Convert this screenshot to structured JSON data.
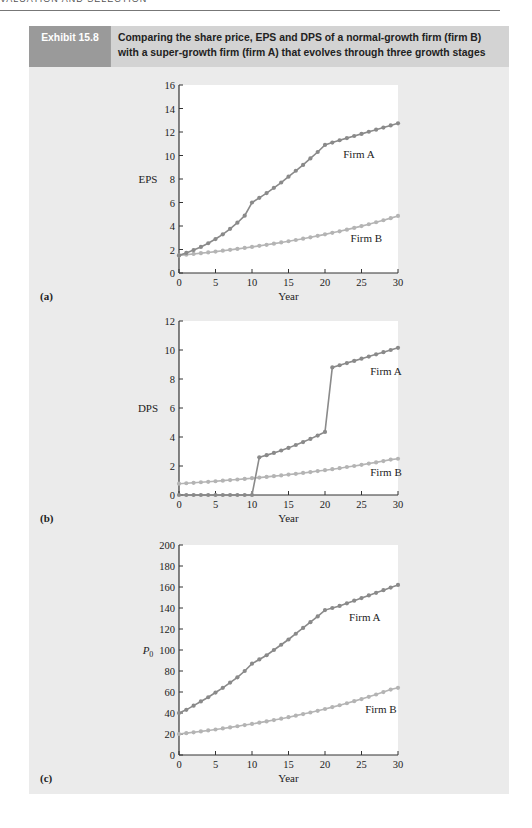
{
  "running_head": "VALUATION AND SELECTION",
  "exhibit": {
    "label": "Exhibit 15.8",
    "title_line1": "Comparing the share price, EPS and DPS of a normal-growth firm (firm B)",
    "title_line2": "with a super-growth firm (firm A) that evolves through three growth stages"
  },
  "colors": {
    "panel_bg": "#ebebeb",
    "header_bg": "#d3d3d3",
    "label_bg": "#9a9a9a",
    "plot_bg": "#ffffff",
    "firm_a": "#8a8a8a",
    "firm_b": "#b4b4b4",
    "axis": "#333333"
  },
  "chart_data": [
    {
      "id": "a",
      "panel_label": "(a)",
      "type": "line",
      "title": "",
      "xlabel": "Year",
      "ylabel": "EPS",
      "xlim": [
        0,
        30
      ],
      "ylim": [
        0,
        16
      ],
      "xticks": [
        0,
        5,
        10,
        15,
        20,
        25,
        30
      ],
      "yticks": [
        0,
        2,
        4,
        6,
        8,
        10,
        12,
        14,
        16
      ],
      "grid": false,
      "legend": "inline labels",
      "x": [
        0,
        1,
        2,
        3,
        4,
        5,
        6,
        7,
        8,
        9,
        10,
        11,
        12,
        13,
        14,
        15,
        16,
        17,
        18,
        19,
        20,
        21,
        22,
        23,
        24,
        25,
        26,
        27,
        28,
        29,
        30
      ],
      "series": [
        {
          "name": "Firm A",
          "label_pos": [
            22.5,
            9.8
          ],
          "values": [
            1.5,
            1.71,
            1.95,
            2.22,
            2.53,
            2.89,
            3.29,
            3.76,
            4.28,
            4.88,
            6.0,
            6.4,
            6.8,
            7.25,
            7.7,
            8.2,
            8.7,
            9.2,
            9.75,
            10.3,
            10.9,
            11.1,
            11.3,
            11.48,
            11.66,
            11.84,
            12.02,
            12.2,
            12.38,
            12.56,
            12.74
          ]
        },
        {
          "name": "Firm B",
          "label_pos": [
            23.5,
            2.6
          ],
          "values": [
            1.5,
            1.56,
            1.62,
            1.69,
            1.75,
            1.82,
            1.9,
            1.97,
            2.05,
            2.13,
            2.22,
            2.31,
            2.4,
            2.5,
            2.6,
            2.7,
            2.81,
            2.92,
            3.04,
            3.16,
            3.29,
            3.42,
            3.55,
            3.69,
            3.84,
            3.99,
            4.15,
            4.32,
            4.49,
            4.67,
            4.86
          ]
        }
      ]
    },
    {
      "id": "b",
      "panel_label": "(b)",
      "type": "line",
      "title": "",
      "xlabel": "Year",
      "ylabel": "DPS",
      "xlim": [
        0,
        30
      ],
      "ylim": [
        0,
        12
      ],
      "xticks": [
        0,
        5,
        10,
        15,
        20,
        25,
        30
      ],
      "yticks": [
        0,
        2,
        4,
        6,
        8,
        10,
        12
      ],
      "grid": false,
      "legend": "inline labels",
      "x": [
        0,
        1,
        2,
        3,
        4,
        5,
        6,
        7,
        8,
        9,
        10,
        11,
        12,
        13,
        14,
        15,
        16,
        17,
        18,
        19,
        20,
        21,
        22,
        23,
        24,
        25,
        26,
        27,
        28,
        29,
        30
      ],
      "series": [
        {
          "name": "Firm A",
          "label_pos": [
            26.2,
            8.3
          ],
          "values": [
            0,
            0,
            0,
            0,
            0,
            0,
            0,
            0,
            0,
            0,
            0,
            2.6,
            2.75,
            2.9,
            3.07,
            3.25,
            3.45,
            3.65,
            3.87,
            4.1,
            4.35,
            8.8,
            8.95,
            9.1,
            9.25,
            9.4,
            9.55,
            9.7,
            9.85,
            10.0,
            10.15
          ]
        },
        {
          "name": "Firm B",
          "label_pos": [
            26.2,
            1.3
          ],
          "values": [
            0.78,
            0.81,
            0.84,
            0.88,
            0.91,
            0.95,
            0.99,
            1.03,
            1.07,
            1.11,
            1.16,
            1.2,
            1.25,
            1.3,
            1.35,
            1.41,
            1.46,
            1.52,
            1.58,
            1.65,
            1.71,
            1.78,
            1.85,
            1.93,
            2.0,
            2.08,
            2.17,
            2.25,
            2.34,
            2.44,
            2.5
          ]
        }
      ]
    },
    {
      "id": "c",
      "panel_label": "(c)",
      "type": "line",
      "title": "",
      "xlabel": "Year",
      "ylabel": "P0",
      "xlim": [
        0,
        30
      ],
      "ylim": [
        0,
        200
      ],
      "xticks": [
        0,
        5,
        10,
        15,
        20,
        25,
        30
      ],
      "yticks": [
        0,
        20,
        40,
        60,
        80,
        100,
        120,
        140,
        160,
        180,
        200
      ],
      "grid": false,
      "legend": "inline labels",
      "x": [
        0,
        1,
        2,
        3,
        4,
        5,
        6,
        7,
        8,
        9,
        10,
        11,
        12,
        13,
        14,
        15,
        16,
        17,
        18,
        19,
        20,
        21,
        22,
        23,
        24,
        25,
        26,
        27,
        28,
        29,
        30
      ],
      "series": [
        {
          "name": "Firm A",
          "label_pos": [
            23.3,
            128
          ],
          "values": [
            40,
            43,
            47,
            51,
            55,
            59.5,
            64,
            69,
            74,
            80,
            87,
            91,
            95,
            100,
            105,
            110,
            115.5,
            121,
            126.5,
            132,
            138,
            140,
            142,
            144.5,
            147,
            149.5,
            152,
            154.5,
            157,
            159.5,
            162
          ]
        },
        {
          "name": "Firm B",
          "label_pos": [
            25.5,
            40
          ],
          "values": [
            20,
            20.8,
            21.6,
            22.5,
            23.4,
            24.3,
            25.3,
            26.3,
            27.4,
            28.5,
            29.6,
            30.8,
            32,
            33.3,
            34.6,
            36,
            37.5,
            39,
            40.5,
            42.1,
            43.8,
            45.6,
            47.4,
            49.3,
            51.3,
            53.3,
            55.4,
            57.6,
            59.9,
            62.3,
            64
          ]
        }
      ]
    }
  ]
}
